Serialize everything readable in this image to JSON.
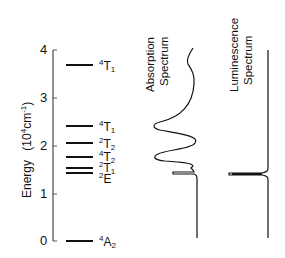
{
  "axis": {
    "title_main": "Energy",
    "title_unit_open": "(10",
    "title_unit_sup1": "4",
    "title_unit_mid": "cm",
    "title_unit_sup2": "-1",
    "title_unit_close": ")",
    "ticks": [
      "0",
      "1",
      "2",
      "3",
      "4"
    ]
  },
  "levels": [
    {
      "term_sup": "4",
      "term": "T",
      "term_sub": "1",
      "energy": 3.7
    },
    {
      "term_sup": "4",
      "term": "T",
      "term_sub": "1",
      "energy": 2.4
    },
    {
      "term_sup": "2",
      "term": "T",
      "term_sub": "2",
      "energy": 2.05
    },
    {
      "term_sup": "4",
      "term": "T",
      "term_sub": "2",
      "energy": 1.76
    },
    {
      "term_sup": "2",
      "term": "T",
      "term_sub": "1",
      "energy": 1.52
    },
    {
      "term_sup": "2",
      "term": "E",
      "term_sub": "",
      "energy": 1.42
    },
    {
      "term_sup": "4",
      "term": "A",
      "term_sub": "2",
      "energy": 0.0
    }
  ],
  "spectra": {
    "absorption": {
      "line1": "Absorption",
      "line2": "Spectrum"
    },
    "luminescence": {
      "line1": "Luminescence",
      "line2": "Spectrum"
    }
  },
  "colors": {
    "ink": "#111111",
    "axis": "#555555",
    "background": "#ffffff"
  }
}
